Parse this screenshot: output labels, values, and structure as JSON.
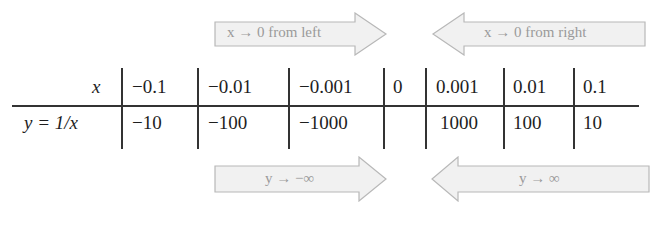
{
  "arrows": {
    "top_left": {
      "label": "x → 0 from left",
      "direction": "right"
    },
    "top_right": {
      "label": "x → 0 from right",
      "direction": "left"
    },
    "bottom_left": {
      "label": "y → −∞",
      "direction": "right"
    },
    "bottom_right": {
      "label": "y → ∞",
      "direction": "left"
    }
  },
  "table": {
    "row_headers": [
      "x",
      "y = 1/x"
    ],
    "x_values": [
      "−0.1",
      "−0.01",
      "−0.001",
      "0",
      "0.001",
      "0.01",
      "0.1"
    ],
    "y_values": [
      "−10",
      "−100",
      "−1000",
      "",
      "1000",
      "100",
      "10"
    ]
  },
  "colors": {
    "arrow_fill": "#f0f0f0",
    "arrow_stroke": "#b5b5b5",
    "arrow_text": "#9a9a9a",
    "table_text": "#1e1e1e",
    "rule": "#333333"
  }
}
